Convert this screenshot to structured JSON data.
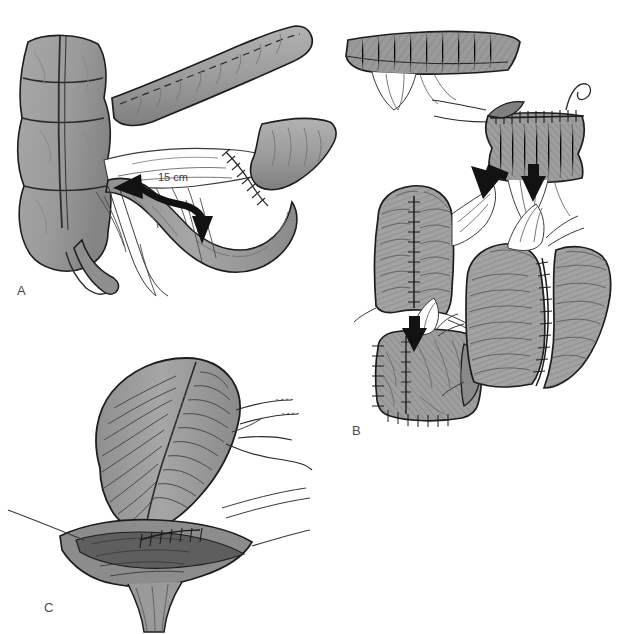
{
  "figure": {
    "background_color": "#ffffff",
    "panels": [
      {
        "id": "A",
        "label": "A",
        "caption": "Colon with appendix, terminal ileum and mesentery; curved double-headed arrow marks the limb to be folded",
        "annotation": "15 cm"
      },
      {
        "id": "B",
        "label": "B",
        "caption": "Sequential steps of pouch construction: opened bowel limb, suture line closure, folded pouch"
      },
      {
        "id": "C",
        "label": "C",
        "caption": "Completed pouch sutured to the anal canal"
      }
    ],
    "annotations": {
      "length_label": "15 cm"
    },
    "colors": {
      "tissue_fill": "#9a9a9a",
      "tissue_fill_light": "#b4b4b4",
      "tissue_fill_dark": "#7d7d7d",
      "outline": "#1d1d1d",
      "serosa_shadow": "#6a6a6a",
      "arrow": "#121212",
      "label_text": "#4a4a4a",
      "background": "#ffffff",
      "suture": "#2a2a2a"
    },
    "arrows": [
      {
        "name": "fold-arrow-left",
        "panel": "A",
        "direction": "left"
      },
      {
        "name": "fold-arrow-down",
        "panel": "A",
        "direction": "down"
      },
      {
        "name": "step-arrow-diagonal",
        "panel": "B",
        "direction": "down-left"
      },
      {
        "name": "step-arrow-down-right",
        "panel": "B",
        "direction": "down"
      },
      {
        "name": "step-arrow-down-left",
        "panel": "B",
        "direction": "down"
      }
    ]
  }
}
